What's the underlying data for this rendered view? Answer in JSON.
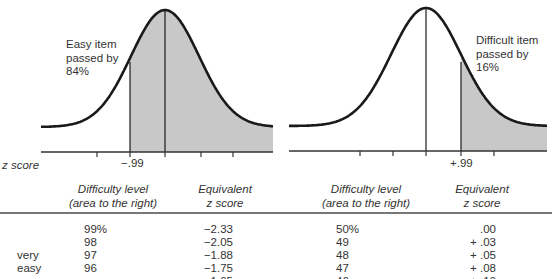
{
  "figure": {
    "left_curve": {
      "annotation_lines": [
        "Easy item",
        "passed by",
        "84%"
      ],
      "cutoff_label": "−.99",
      "axis_label": "z score"
    },
    "right_curve": {
      "annotation_lines": [
        "Difficult item",
        "passed by",
        "16%"
      ],
      "cutoff_label": "+.99"
    },
    "colors": {
      "curve": "#1a1a1a",
      "shade": "#c8c8c8",
      "axis": "#333333",
      "rule": "#777777"
    }
  },
  "table": {
    "headers": {
      "left_difficulty": [
        "Difficulty level",
        "(area to the right)"
      ],
      "left_z": [
        "Equivalent",
        "z score"
      ],
      "right_difficulty": [
        "Difficulty level",
        "(area to the right)"
      ],
      "right_z": [
        "Equivalent",
        "z score"
      ]
    },
    "row_group_label": [
      "very",
      "easy"
    ],
    "left_rows": [
      {
        "difficulty": "99%",
        "z": "−2.33"
      },
      {
        "difficulty": "98",
        "z": "−2.05"
      },
      {
        "difficulty": "97",
        "z": "−1.88"
      },
      {
        "difficulty": "96",
        "z": "−1.75"
      }
    ],
    "right_rows": [
      {
        "difficulty": "50%",
        "z": ".00"
      },
      {
        "difficulty": "49",
        "z": "+ .03"
      },
      {
        "difficulty": "48",
        "z": "+ .05"
      },
      {
        "difficulty": "47",
        "z": "+ .08"
      }
    ]
  }
}
